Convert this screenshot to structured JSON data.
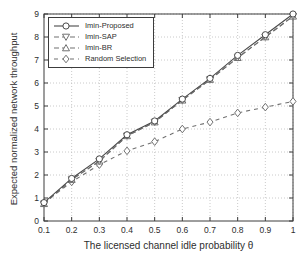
{
  "figure": {
    "background": "#ffffff",
    "axes_color": "#3c3c3c",
    "grid_color": "#bcbcbc",
    "text_color": "#2e2e2e"
  },
  "chart_data": {
    "type": "line",
    "title": "",
    "xlabel": "The licensed channel idle probability θ",
    "ylabel": "Expected normalized network throughput",
    "xlim": [
      0.1,
      1.0
    ],
    "ylim": [
      0,
      9
    ],
    "grid": "dotted",
    "legend_position": "top-left",
    "x": [
      0.1,
      0.2,
      0.3,
      0.4,
      0.5,
      0.6,
      0.7,
      0.8,
      0.9,
      1.0
    ],
    "xtick_labels": [
      "0.1",
      "0.2",
      "0.3",
      "0.4",
      "0.5",
      "0.6",
      "0.7",
      "0.8",
      "0.9",
      "1"
    ],
    "ytick_values": [
      0,
      1,
      2,
      3,
      4,
      5,
      6,
      7,
      8,
      9
    ],
    "ytick_labels": [
      "0",
      "1",
      "2",
      "3",
      "4",
      "5",
      "6",
      "7",
      "8",
      "9"
    ],
    "series": [
      {
        "name": "Imin-Proposed",
        "marker": "circle",
        "line": "solid",
        "color": "#4a4a4a",
        "values": [
          0.8,
          1.85,
          2.7,
          3.75,
          4.35,
          5.3,
          6.2,
          7.2,
          8.1,
          9.0
        ]
      },
      {
        "name": "Imin-SAP",
        "marker": "triangle-down",
        "line": "dashed",
        "color": "#707070",
        "values": [
          0.75,
          1.8,
          2.6,
          3.7,
          4.3,
          5.25,
          6.15,
          7.1,
          8.0,
          8.9
        ]
      },
      {
        "name": "Imin-BR",
        "marker": "triangle-up",
        "line": "dashed",
        "color": "#707070",
        "values": [
          0.75,
          1.8,
          2.6,
          3.7,
          4.3,
          5.25,
          6.15,
          7.1,
          8.0,
          8.9
        ]
      },
      {
        "name": "Random Selection",
        "marker": "diamond",
        "line": "dashed-wide",
        "color": "#707070",
        "values": [
          0.8,
          1.7,
          2.45,
          3.05,
          3.45,
          4.0,
          4.3,
          4.7,
          4.95,
          5.2
        ]
      }
    ]
  }
}
